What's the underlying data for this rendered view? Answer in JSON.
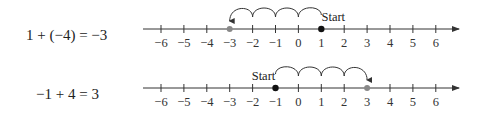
{
  "rows": [
    {
      "equation": "1 + (−4) = −3",
      "start_label": "Start",
      "start_value": 1,
      "end_value": -3,
      "direction": "left",
      "hops": 4,
      "tick_labels": [
        "−6",
        "−5",
        "−4",
        "−3",
        "−2",
        "−1",
        "0",
        "1",
        "2",
        "3",
        "4",
        "5",
        "6"
      ]
    },
    {
      "equation": "−1 + 4 = 3",
      "start_label": "Start",
      "start_value": -1,
      "end_value": 3,
      "direction": "right",
      "hops": 4,
      "tick_labels": [
        "−6",
        "−5",
        "−4",
        "−3",
        "−2",
        "−1",
        "0",
        "1",
        "2",
        "3",
        "4",
        "5",
        "6"
      ]
    }
  ],
  "colors": {
    "axis": "#333333",
    "result_highlight": "#888888",
    "start_dot": "#111111"
  }
}
